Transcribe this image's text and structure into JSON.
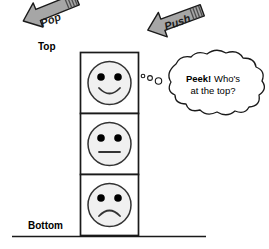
{
  "diagram": {
    "labels": {
      "top": "Top",
      "bottom": "Bottom"
    },
    "operations": [
      {
        "name": "pop",
        "label": "Pop",
        "direction": "up-left",
        "color": "#a6a6a6"
      },
      {
        "name": "push",
        "label": "Push",
        "direction": "down-left",
        "color": "#a6a6a6"
      },
      {
        "name": "peek",
        "label_bold": "Peek!",
        "label_rest": " Who's",
        "label_line2": "at the top?"
      }
    ],
    "stack": {
      "items": [
        {
          "position": "top",
          "face": "happy-face-icon"
        },
        {
          "position": "middle",
          "face": "neutral-face-icon"
        },
        {
          "position": "bottom",
          "face": "sad-face-icon"
        }
      ]
    },
    "colors": {
      "outline": "#1a1a1a",
      "face_fill": "#f0f0f0",
      "arrow_fill": "#a6a6a6",
      "arrow_stripes": "#595959",
      "background": "#ffffff"
    }
  }
}
